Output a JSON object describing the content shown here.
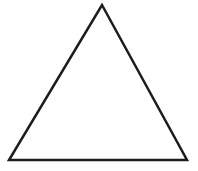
{
  "canvas": {
    "width": 198,
    "height": 171,
    "background": "#ffffff"
  },
  "figure": {
    "shape": "triangle",
    "vertices": [
      [
        102,
        5
      ],
      [
        187,
        160
      ],
      [
        9,
        160
      ]
    ],
    "stroke_color": "#1c1c1c",
    "stroke_width": 2.5,
    "fill": "none"
  }
}
